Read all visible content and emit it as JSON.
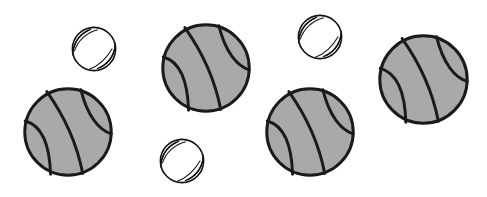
{
  "scene": {
    "title": "Scattered balls illustration",
    "width": 487,
    "height": 197,
    "background_color": "#ffffff",
    "description": "Seven balls scattered on a white background: four large gray basketballs and three smaller white baseballs with stitching.",
    "counts": {
      "basketballs": 4,
      "baseballs": 3,
      "total": 7
    }
  },
  "palette": {
    "basketball_fill": "#a9a9a9",
    "basketball_line": "#1a1a1a",
    "baseball_fill": "#ffffff",
    "baseball_line": "#141414",
    "stitch_color": "#141414",
    "background": "#ffffff"
  },
  "balls": [
    {
      "id": "baseball-1",
      "type": "baseball",
      "label": "Baseball",
      "x": 70,
      "y": 25,
      "size": 48,
      "rotation": 0
    },
    {
      "id": "basketball-1",
      "type": "basketball",
      "label": "Basketball",
      "x": 22,
      "y": 86,
      "size": 92,
      "rotation": 0
    },
    {
      "id": "basketball-2",
      "type": "basketball",
      "label": "Basketball",
      "x": 160,
      "y": 22,
      "size": 92,
      "rotation": 0
    },
    {
      "id": "baseball-2",
      "type": "baseball",
      "label": "Baseball",
      "x": 158,
      "y": 137,
      "size": 48,
      "rotation": 0
    },
    {
      "id": "baseball-3",
      "type": "baseball",
      "label": "Baseball",
      "x": 296,
      "y": 13,
      "size": 48,
      "rotation": 0
    },
    {
      "id": "basketball-3",
      "type": "basketball",
      "label": "Basketball",
      "x": 264,
      "y": 86,
      "size": 92,
      "rotation": 0
    },
    {
      "id": "basketball-4",
      "type": "basketball",
      "label": "Basketball",
      "x": 377,
      "y": 33,
      "size": 93,
      "rotation": 0
    }
  ]
}
